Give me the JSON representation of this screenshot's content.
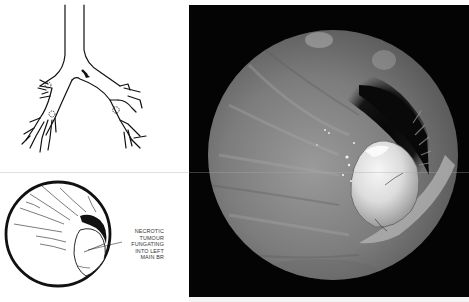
{
  "figure": {
    "diagram": {
      "label": "bronchial-tree-diagram",
      "marker": "arrow pointing to origin of left main bronchus"
    },
    "endoscopic_sketch": {
      "caption_lines": [
        "NECROTIC",
        "TUMOUR",
        "FUNGATING",
        "INTO LEFT",
        "MAIN BR"
      ]
    },
    "photo": {
      "label": "bronchoscopic-photograph",
      "subject": "necrotic tumour fungating into left main bronchus"
    }
  },
  "colors": {
    "page": "#ffffff",
    "ink": "#111111",
    "photo_frame": "#040404",
    "mucosa": "#8a8a8a",
    "tumour": "#e8e8e8"
  }
}
